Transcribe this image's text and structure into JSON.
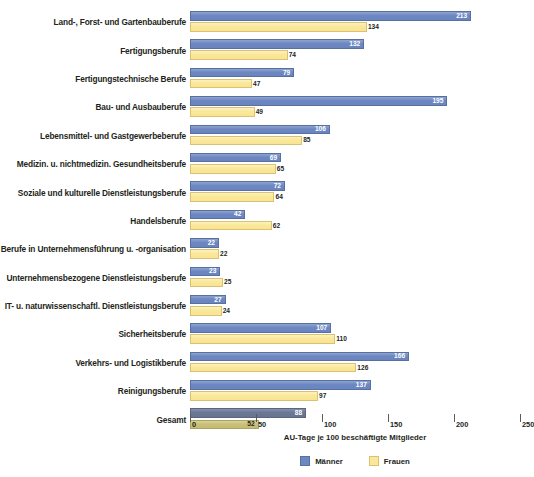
{
  "chart_data": {
    "type": "bar",
    "title": "",
    "orientation": "horizontal",
    "xlabel": "AU-Tage je 100 beschäftigte Mitglieder",
    "ylabel": "",
    "xlim": [
      0,
      250
    ],
    "xticks": [
      0,
      50,
      100,
      150,
      200,
      250
    ],
    "grid": false,
    "legend_position": "bottom-center",
    "categories": [
      "Land-, Forst- und Gartenbauberufe",
      "Fertigungsberufe",
      "Fertigungstechnische Berufe",
      "Bau- und Ausbauberufe",
      "Lebensmittel- und Gastgewerbeberufe",
      "Medizin. u. nichtmedizin. Gesundheitsberufe",
      "Soziale und kulturelle Dienstleistungsberufe",
      "Handelsberufe",
      "Berufe in Unternehmensführung u. -organisation",
      "Unternehmensbezogene Dienstleistungsberufe",
      "IT- u. naturwissenschaftl. Dienstleistungsberufe",
      "Sicherheitsberufe",
      "Verkehrs- und Logistikberufe",
      "Reinigungsberufe",
      "Gesamt"
    ],
    "series": [
      {
        "name": "Männer",
        "color": "#6d87c2",
        "values": [
          213,
          132,
          79,
          195,
          106,
          69,
          72,
          42,
          22,
          23,
          27,
          107,
          166,
          137,
          88
        ]
      },
      {
        "name": "Frauen",
        "color": "#fae79a",
        "values": [
          134,
          74,
          47,
          49,
          85,
          65,
          64,
          62,
          22,
          25,
          24,
          110,
          126,
          97,
          52
        ]
      }
    ],
    "highlight_row": "Gesamt",
    "highlight_colors": {
      "maenner": "#6b7794",
      "frauen": "#c9c078"
    }
  },
  "legend": {
    "items": [
      {
        "label": "Männer",
        "color": "#6d87c2"
      },
      {
        "label": "Frauen",
        "color": "#fae79a"
      }
    ]
  },
  "axis": {
    "tick_labels": [
      "0",
      "50",
      "100",
      "150",
      "200",
      "250"
    ],
    "title": "AU-Tage je 100 beschäftigte Mitglieder"
  }
}
